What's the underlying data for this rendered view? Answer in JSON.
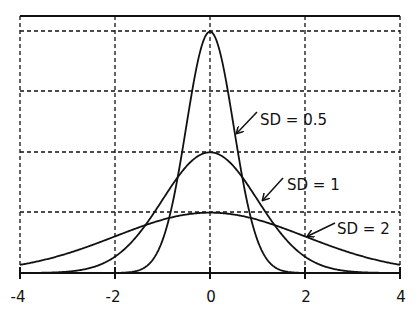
{
  "chart_data": {
    "type": "line",
    "title": "",
    "xlabel": "",
    "ylabel": "",
    "xlim": [
      -4,
      4
    ],
    "ylim": [
      0,
      0.85
    ],
    "x_ticks": [
      -4,
      -2,
      0,
      2,
      4
    ],
    "x_tick_labels": [
      "-4",
      "-2",
      "0",
      "2",
      "4"
    ],
    "y_gridlines": [
      0.2,
      0.4,
      0.6,
      0.8
    ],
    "grid": true,
    "grid_style": "dashed",
    "legend": "none (inline arrow annotations)",
    "series": [
      {
        "name": "SD = 0.5",
        "mean": 0,
        "sd": 0.5,
        "peak": 0.798
      },
      {
        "name": "SD = 1",
        "mean": 0,
        "sd": 1,
        "peak": 0.399
      },
      {
        "name": "SD = 2",
        "mean": 0,
        "sd": 2,
        "peak": 0.199
      }
    ],
    "annotations": [
      {
        "text": "SD = 0.5",
        "points_to_x": 0.55
      },
      {
        "text": "SD = 1",
        "points_to_x": 1.1
      },
      {
        "text": "SD = 2",
        "points_to_x": 2.0
      }
    ]
  },
  "labels": {
    "sd05": "SD = 0.5",
    "sd1": "SD = 1",
    "sd2": "SD = 2",
    "tick_m4": "-4",
    "tick_m2": "-2",
    "tick_0": "0",
    "tick_2": "2",
    "tick_4": "4"
  },
  "colors": {
    "line": "#111111",
    "grid": "#111111",
    "background": "#ffffff"
  }
}
